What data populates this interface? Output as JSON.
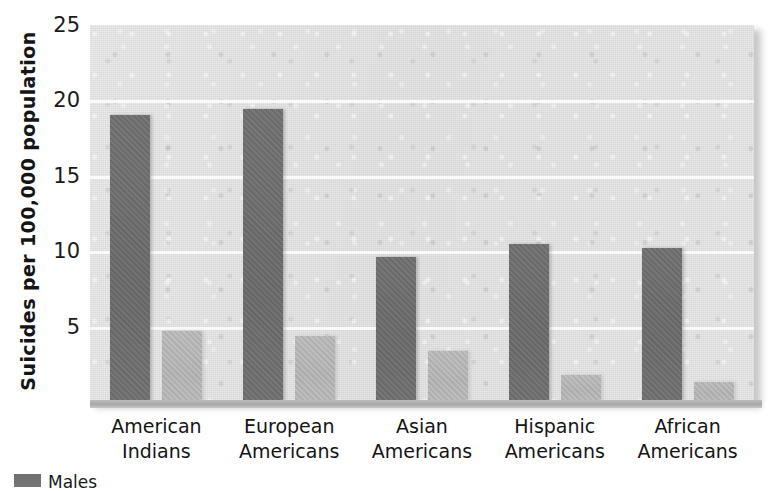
{
  "chart_data": {
    "type": "bar",
    "title": "",
    "subtitle": "",
    "xlabel": "",
    "ylabel": "Suicides per 100,000 population",
    "categories": [
      "American Indians",
      "European Americans",
      "Asian Americans",
      "Hispanic Americans",
      "African Americans"
    ],
    "category_lines": [
      [
        "American",
        "Indians"
      ],
      [
        "European",
        "Americans"
      ],
      [
        "Asian",
        "Americans"
      ],
      [
        "Hispanic",
        "Americans"
      ],
      [
        "African",
        "Americans"
      ]
    ],
    "series": [
      {
        "name": "Males",
        "color": "#6e6e6e",
        "values": [
          19.0,
          19.4,
          9.6,
          10.5,
          10.2
        ]
      },
      {
        "name": "Females",
        "color": "#b5b5b5",
        "values": [
          4.7,
          4.4,
          3.4,
          1.8,
          1.3
        ]
      }
    ],
    "ylim": [
      0,
      25
    ],
    "yticks": [
      5,
      10,
      15,
      20,
      25
    ],
    "ytick_labels": [
      "5",
      "10",
      "15",
      "20",
      "25"
    ],
    "grid": "horizontal",
    "legend_position": "bottom-left",
    "legend_note": "legend is cropped by the bottom edge of the image; only the first dark swatch and clipped text tops are visible"
  },
  "legend": {
    "items": [
      {
        "label": "Males",
        "color": "#6e6e6e"
      }
    ]
  },
  "colors": {
    "male_bar": "#6e6e6e",
    "female_bar": "#b5b5b5",
    "plot_background": "#e2e2e2",
    "gridline": "#fbfbfb",
    "page_background": "#ffffff",
    "text": "#151515"
  }
}
